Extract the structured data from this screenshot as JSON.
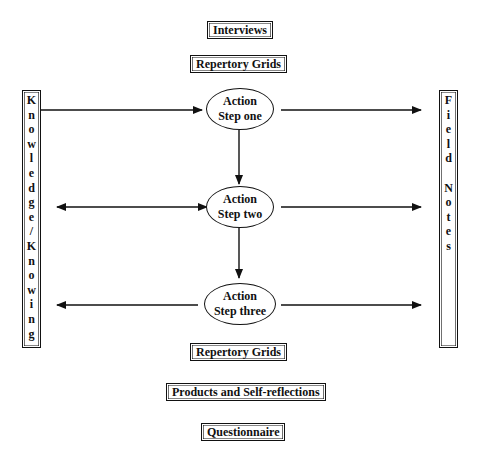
{
  "diagram": {
    "top_boxes": [
      {
        "label": "Interviews"
      },
      {
        "label": "Repertory Grids"
      }
    ],
    "left_column": {
      "label": "Knowledge/Knowing",
      "letters": [
        "K",
        "n",
        "o",
        "w",
        "l",
        "e",
        "d",
        "g",
        "e",
        "/",
        "K",
        "n",
        "o",
        "w",
        "i",
        "n",
        "g"
      ]
    },
    "right_column": {
      "label": "Field Notes",
      "letters": [
        "F",
        "i",
        "e",
        "l",
        "d",
        "",
        "N",
        "o",
        "t",
        "e",
        "s"
      ]
    },
    "steps": [
      {
        "line1": "Action",
        "line2": "Step one"
      },
      {
        "line1": "Action",
        "line2": "Step two"
      },
      {
        "line1": "Action",
        "line2": "Step three"
      }
    ],
    "bottom_boxes": [
      {
        "label": "Repertory Grids"
      },
      {
        "label": "Products and Self-reflections"
      },
      {
        "label": "Questionnaire"
      }
    ],
    "colors": {
      "stroke": "#111111",
      "background": "#ffffff"
    }
  }
}
